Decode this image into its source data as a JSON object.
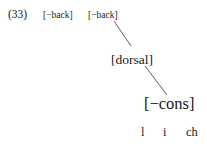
{
  "example": {
    "number": "(33)",
    "features": {
      "back_1": "[−back]",
      "back_2": "[−back]",
      "dorsal": "[dorsal]",
      "cons": "[−cons]"
    },
    "segments": [
      "l",
      "i",
      "ch"
    ],
    "association_lines": [
      {
        "from": "back_2",
        "to": "dorsal"
      },
      {
        "from": "dorsal",
        "to": "cons"
      }
    ]
  }
}
